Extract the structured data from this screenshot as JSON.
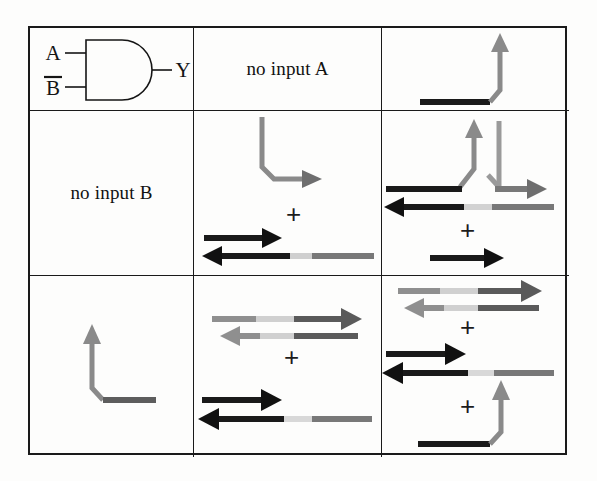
{
  "figure": {
    "kind": "logic-gate-dna-strand-displacement-truth-table",
    "grid": {
      "rows": 3,
      "cols": 3
    }
  },
  "colors": {
    "ink_black": "#151515",
    "strand_black": "#1a1a1a",
    "strand_gray": "#8a8a8a",
    "strand_gray_light": "#b8b8b8",
    "strand_gray_mid": "#707070",
    "border": "#1a1a1a",
    "paper": "#fdfdfc"
  },
  "cells": {
    "r1c1": {
      "name": "and-gate-diagram",
      "input_a": "A",
      "input_b": "B",
      "input_b_overbar": true,
      "output": "Y",
      "gate_type": "AND"
    },
    "r1c2": {
      "name": "no-input-a-label",
      "text": "no input A"
    },
    "r1c3": {
      "name": "output-strand-only",
      "elements": [
        "black-bar",
        "gray-bent-up-arrow"
      ]
    },
    "r2c1": {
      "name": "no-input-b-label",
      "text": "no input B"
    },
    "r2c2": {
      "name": "input-a-and-gate-complex",
      "elements": [
        "gray-bent-down-right-arrow",
        "plus",
        "black-duplex"
      ],
      "plus_count": 1
    },
    "r2c3": {
      "name": "input-a-reacted-complex",
      "elements": [
        "gray-y-junction",
        "black-bar-left",
        "gray-right-arrow",
        "black-left-arrow",
        "plus",
        "black-right-arrow"
      ],
      "plus_count": 1
    },
    "r3c1": {
      "name": "input-b-strand",
      "elements": [
        "gray-bent-up-arrow"
      ]
    },
    "r3c2": {
      "name": "input-b-and-gate-complex",
      "elements": [
        "gray-duplex",
        "plus",
        "black-duplex"
      ],
      "plus_count": 1
    },
    "r3c3": {
      "name": "both-inputs-output-released",
      "elements": [
        "gray-duplex",
        "plus",
        "black-duplex",
        "plus",
        "black-bar-gray-bent-up-arrow"
      ],
      "plus_count": 2
    }
  },
  "symbols": {
    "plus": "+"
  }
}
